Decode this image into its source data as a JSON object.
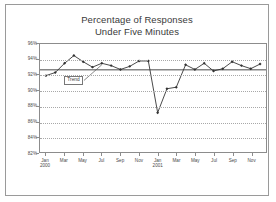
{
  "chart_data": {
    "type": "line",
    "title": "Percentage of Responses Under Five Minutes",
    "title_line1": "Percentage of Responses",
    "title_line2": "Under Five Minutes",
    "xlabel": "",
    "ylabel": "",
    "ylim": [
      82,
      96
    ],
    "ytick_values": [
      82,
      84,
      86,
      88,
      90,
      92,
      94,
      96
    ],
    "ytick_labels": [
      "82%",
      "84%",
      "86%",
      "88%",
      "90%",
      "92%",
      "94%",
      "96%"
    ],
    "grid": true,
    "grid_style": "dotted-horizontal",
    "legend": false,
    "x": [
      "Jan 2000",
      "Feb 2000",
      "Mar 2000",
      "Apr 2000",
      "May 2000",
      "Jun 2000",
      "Jul 2000",
      "Aug 2000",
      "Sep 2000",
      "Oct 2000",
      "Nov 2000",
      "Dec 2000",
      "Jan 2001",
      "Feb 2001",
      "Mar 2001",
      "Apr 2001",
      "May 2001",
      "Jun 2001",
      "Jul 2001",
      "Aug 2001",
      "Sep 2001",
      "Oct 2001",
      "Nov 2001",
      "Dec 2001"
    ],
    "xtick_labels": [
      {
        "label": "Jan",
        "year": "2000",
        "index": 0
      },
      {
        "label": "Mar",
        "year": "",
        "index": 2
      },
      {
        "label": "May",
        "year": "",
        "index": 4
      },
      {
        "label": "Jul",
        "year": "",
        "index": 6
      },
      {
        "label": "Sep",
        "year": "",
        "index": 8
      },
      {
        "label": "Nov",
        "year": "",
        "index": 10
      },
      {
        "label": "Jan",
        "year": "2001",
        "index": 12
      },
      {
        "label": "Mar",
        "year": "",
        "index": 14
      },
      {
        "label": "May",
        "year": "",
        "index": 16
      },
      {
        "label": "Jul",
        "year": "",
        "index": 18
      },
      {
        "label": "Sep",
        "year": "",
        "index": 20
      },
      {
        "label": "Nov",
        "year": "",
        "index": 22
      }
    ],
    "series": [
      {
        "name": "Percentage of Responses Under Five Minutes",
        "marker": "filled-diamond",
        "color": "#333333",
        "values": [
          91.9,
          92.3,
          93.5,
          94.5,
          93.7,
          93.0,
          93.5,
          93.2,
          92.7,
          93.1,
          93.8,
          93.8,
          87.1,
          90.2,
          90.4,
          93.3,
          92.7,
          93.5,
          92.5,
          92.8,
          93.7,
          93.2,
          92.8,
          93.4
        ]
      },
      {
        "name": "Trend",
        "type": "trendline",
        "style": "solid-flat",
        "color": "#333333",
        "value": 92.65
      }
    ],
    "annotations": [
      {
        "name": "trend-callout",
        "text": "Trend",
        "box": true,
        "leader_line": true,
        "points_to_index": 6
      }
    ]
  }
}
